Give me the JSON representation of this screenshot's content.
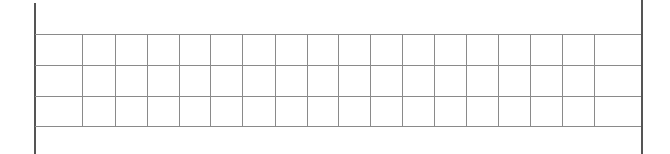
{
  "grid": {
    "background_color": "#ffffff",
    "border_color": "#555555",
    "line_color": "#8a8a8a",
    "left_border": {
      "x": 34,
      "top": 3,
      "bottom": 154
    },
    "right_border": {
      "x": 641,
      "top": 0,
      "bottom": 154
    },
    "rows_y": [
      34,
      65,
      96,
      126
    ],
    "columns_x": [
      82,
      115,
      147,
      179,
      210,
      242,
      275,
      307,
      338,
      370,
      402,
      434,
      466,
      498,
      530,
      562,
      594
    ],
    "row_count": 3,
    "column_count": 18
  }
}
